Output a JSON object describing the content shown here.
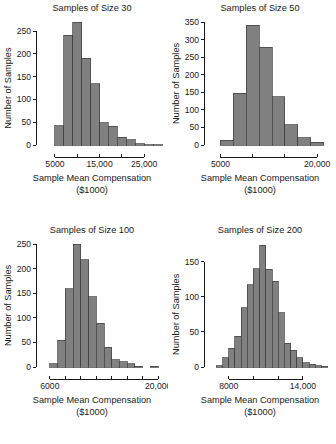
{
  "figure": {
    "layout": "2x2 grid of histograms",
    "bar_fill": "#808080",
    "bar_stroke": "#3d3d3d",
    "axis_color": "#1a1a1a"
  },
  "chart_data": [
    {
      "type": "bar",
      "id": "samples-of-size-30",
      "title": "Samples of Size 30",
      "xlabel_line1": "Sample Mean Compensation",
      "xlabel_line2": "($1000)",
      "ylabel": "Number of Samples",
      "xlim": [
        3000,
        29000
      ],
      "ylim": [
        0,
        270
      ],
      "yticks": [
        0,
        50,
        100,
        150,
        200,
        250
      ],
      "ytick_labels": [
        "0",
        "50",
        "100",
        "150",
        "200",
        "250"
      ],
      "xticks": [
        5000,
        10000,
        15000,
        20000,
        25000
      ],
      "xtick_labels": [
        "5000",
        "",
        "15,000",
        "",
        "25,000"
      ],
      "bin_width": 2000,
      "bin_starts": [
        5000,
        7000,
        9000,
        11000,
        13000,
        15000,
        17000,
        19000,
        21000,
        23000,
        25000,
        27000
      ],
      "values": [
        42,
        241,
        269,
        190,
        135,
        49,
        41,
        17,
        12,
        3,
        1,
        1
      ],
      "grid": false,
      "legend": null
    },
    {
      "type": "bar",
      "id": "samples-of-size-50",
      "title": "Samples of Size 50",
      "xlabel_line1": "Sample Mean Compensation",
      "xlabel_line2": "($1000)",
      "ylabel": "Number of Samples",
      "xlim": [
        4000,
        22000
      ],
      "ylim": [
        0,
        350
      ],
      "yticks": [
        0,
        50,
        100,
        150,
        200,
        250,
        300,
        350
      ],
      "ytick_labels": [
        "0",
        "50",
        "100",
        "150",
        "200",
        "250",
        "300",
        "350"
      ],
      "xticks": [
        5000,
        10000,
        15000,
        20000
      ],
      "xtick_labels": [
        "5000",
        "",
        "",
        "20,000"
      ],
      "bin_width": 2000,
      "bin_starts": [
        5000,
        7000,
        9000,
        11000,
        13000,
        15000,
        17000,
        19000
      ],
      "values": [
        13,
        147,
        341,
        278,
        137,
        58,
        20,
        8
      ],
      "grid": false,
      "legend": null
    },
    {
      "type": "bar",
      "id": "samples-of-size-100",
      "title": "Samples of Size 100",
      "xlabel_line1": "Sample Mean Compensation",
      "xlabel_line2": "($1000)",
      "ylabel": "Number of Samples",
      "xlim": [
        5500,
        20500
      ],
      "ylim": [
        0,
        250
      ],
      "yticks": [
        0,
        50,
        100,
        150,
        200,
        250
      ],
      "ytick_labels": [
        "0",
        "50",
        "100",
        "150",
        "200",
        "250"
      ],
      "xticks": [
        6000,
        8000,
        10000,
        12000,
        14000,
        16000,
        18000,
        20000
      ],
      "xtick_labels": [
        "6000",
        "",
        "",
        "",
        "",
        "",
        "",
        "20,000"
      ],
      "bin_width": 1000,
      "bin_starts": [
        6000,
        7000,
        8000,
        9000,
        10000,
        11000,
        12000,
        13000,
        14000,
        15000,
        16000,
        17000,
        18000,
        19000
      ],
      "values": [
        7,
        54,
        159,
        250,
        218,
        143,
        89,
        40,
        15,
        11,
        7,
        2,
        0,
        2
      ],
      "grid": false,
      "legend": null
    },
    {
      "type": "bar",
      "id": "samples-of-size-200",
      "title": "Samples of Size 200",
      "xlabel_line1": "Sample Mean Compensation",
      "xlabel_line2": "($1000)",
      "ylabel": "Number of Samples",
      "xlim": [
        6800,
        16200
      ],
      "ylim": [
        0,
        175
      ],
      "yticks": [
        0,
        50,
        100,
        150
      ],
      "ytick_labels": [
        "0",
        "50",
        "100",
        "150"
      ],
      "xticks": [
        8000,
        10000,
        12000,
        14000
      ],
      "xtick_labels": [
        "8000",
        "",
        "",
        "14,000"
      ],
      "bin_width": 500,
      "bin_starts": [
        7000,
        7500,
        8000,
        8500,
        9000,
        9500,
        10000,
        10500,
        11000,
        11500,
        12000,
        12500,
        13000,
        13500,
        14000,
        14500,
        15000,
        15500
      ],
      "values": [
        2,
        13,
        27,
        44,
        84,
        117,
        140,
        173,
        139,
        122,
        77,
        34,
        24,
        13,
        6,
        4,
        2,
        1
      ],
      "grid": false,
      "legend": null
    }
  ]
}
